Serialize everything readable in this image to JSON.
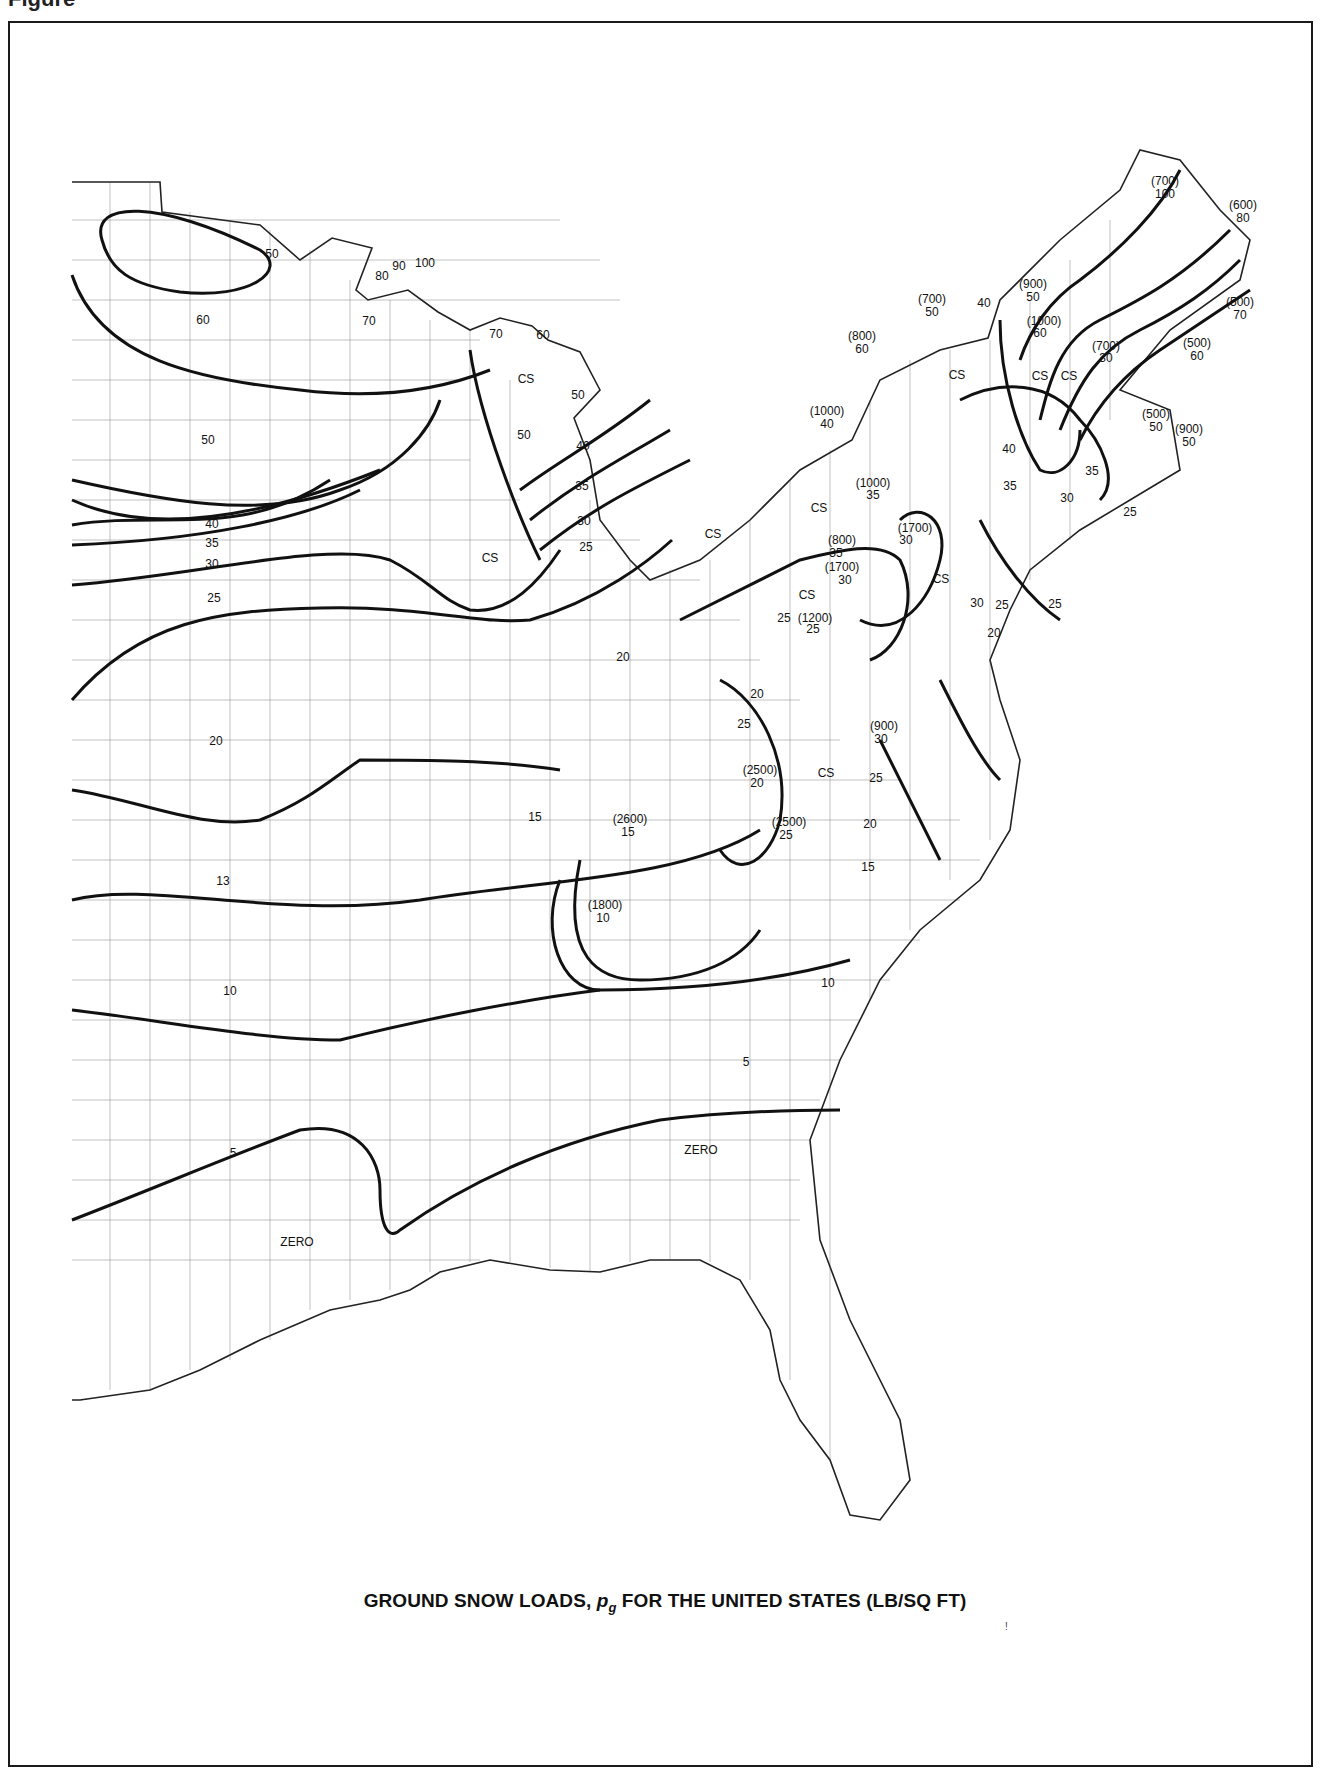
{
  "page": {
    "caption_top": "Figure",
    "title_main": "GROUND SNOW LOADS, ",
    "title_symbol": "p",
    "title_subscript": "g",
    "title_rest": " FOR THE UNITED STATES (LB/SQ FT)",
    "stray_mark": "!"
  },
  "map": {
    "type": "contour map",
    "subject": "Ground snow loads, eastern United States",
    "units": "lb/sq ft",
    "notation": {
      "CS": "Case study required",
      "parenthetical": "(elevation ft) load value"
    },
    "labels": [
      {
        "text": "50",
        "x": 272,
        "y": 258
      },
      {
        "text": "60",
        "x": 203,
        "y": 324
      },
      {
        "text": "50",
        "x": 208,
        "y": 444
      },
      {
        "text": "80",
        "x": 382,
        "y": 280
      },
      {
        "text": "90",
        "x": 399,
        "y": 270
      },
      {
        "text": "100",
        "x": 425,
        "y": 267
      },
      {
        "text": "70",
        "x": 369,
        "y": 325
      },
      {
        "text": "70",
        "x": 496,
        "y": 338
      },
      {
        "text": "60",
        "x": 543,
        "y": 339
      },
      {
        "text": "CS",
        "x": 526,
        "y": 383
      },
      {
        "text": "50",
        "x": 578,
        "y": 399
      },
      {
        "text": "50",
        "x": 524,
        "y": 439
      },
      {
        "text": "40",
        "x": 583,
        "y": 450
      },
      {
        "text": "35",
        "x": 582,
        "y": 490
      },
      {
        "text": "30",
        "x": 584,
        "y": 525
      },
      {
        "text": "25",
        "x": 586,
        "y": 551
      },
      {
        "text": "40",
        "x": 212,
        "y": 528
      },
      {
        "text": "35",
        "x": 212,
        "y": 547
      },
      {
        "text": "30",
        "x": 212,
        "y": 568
      },
      {
        "text": "25",
        "x": 214,
        "y": 602
      },
      {
        "text": "CS",
        "x": 490,
        "y": 562
      },
      {
        "text": "20",
        "x": 623,
        "y": 661
      },
      {
        "text": "20",
        "x": 216,
        "y": 745
      },
      {
        "text": "15",
        "x": 535,
        "y": 821
      },
      {
        "text": "13",
        "x": 223,
        "y": 885
      },
      {
        "text": "10",
        "x": 230,
        "y": 995
      },
      {
        "text": "10",
        "x": 828,
        "y": 987
      },
      {
        "text": "5",
        "x": 746,
        "y": 1066
      },
      {
        "text": "5",
        "x": 233,
        "y": 1157
      },
      {
        "text": "ZERO",
        "x": 297,
        "y": 1246
      },
      {
        "text": "ZERO",
        "x": 701,
        "y": 1154
      },
      {
        "text": "(700)",
        "x": 1165,
        "y": 185
      },
      {
        "text": "100",
        "x": 1165,
        "y": 198
      },
      {
        "text": "(600)",
        "x": 1243,
        "y": 209
      },
      {
        "text": "80",
        "x": 1243,
        "y": 222
      },
      {
        "text": "(900)",
        "x": 1033,
        "y": 288
      },
      {
        "text": "50",
        "x": 1033,
        "y": 301
      },
      {
        "text": "(700)",
        "x": 932,
        "y": 303
      },
      {
        "text": "50",
        "x": 932,
        "y": 316
      },
      {
        "text": "40",
        "x": 984,
        "y": 307
      },
      {
        "text": "(1000)",
        "x": 1044,
        "y": 325
      },
      {
        "text": "60",
        "x": 1040,
        "y": 337
      },
      {
        "text": "(500)",
        "x": 1240,
        "y": 306
      },
      {
        "text": "70",
        "x": 1240,
        "y": 319
      },
      {
        "text": "(800)",
        "x": 862,
        "y": 340
      },
      {
        "text": "60",
        "x": 862,
        "y": 353
      },
      {
        "text": "(500)",
        "x": 1197,
        "y": 347
      },
      {
        "text": "60",
        "x": 1197,
        "y": 360
      },
      {
        "text": "(700)",
        "x": 1106,
        "y": 350
      },
      {
        "text": "30",
        "x": 1106,
        "y": 362
      },
      {
        "text": "CS",
        "x": 957,
        "y": 379
      },
      {
        "text": "CS",
        "x": 1040,
        "y": 380
      },
      {
        "text": "CS",
        "x": 1069,
        "y": 380
      },
      {
        "text": "(1000)",
        "x": 827,
        "y": 415
      },
      {
        "text": "40",
        "x": 827,
        "y": 428
      },
      {
        "text": "(500)",
        "x": 1156,
        "y": 418
      },
      {
        "text": "50",
        "x": 1156,
        "y": 431
      },
      {
        "text": "(900)",
        "x": 1189,
        "y": 433
      },
      {
        "text": "50",
        "x": 1189,
        "y": 446
      },
      {
        "text": "40",
        "x": 1009,
        "y": 453
      },
      {
        "text": "35",
        "x": 1092,
        "y": 475
      },
      {
        "text": "(1000)",
        "x": 873,
        "y": 487
      },
      {
        "text": "35",
        "x": 873,
        "y": 499
      },
      {
        "text": "35",
        "x": 1010,
        "y": 490
      },
      {
        "text": "30",
        "x": 1067,
        "y": 502
      },
      {
        "text": "CS",
        "x": 819,
        "y": 512
      },
      {
        "text": "25",
        "x": 1130,
        "y": 516
      },
      {
        "text": "CS",
        "x": 713,
        "y": 538
      },
      {
        "text": "(1700)",
        "x": 915,
        "y": 532
      },
      {
        "text": "30",
        "x": 906,
        "y": 544
      },
      {
        "text": "(800)",
        "x": 842,
        "y": 544
      },
      {
        "text": "35",
        "x": 836,
        "y": 557
      },
      {
        "text": "(1700)",
        "x": 842,
        "y": 571
      },
      {
        "text": "30",
        "x": 845,
        "y": 584
      },
      {
        "text": "CS",
        "x": 941,
        "y": 583
      },
      {
        "text": "25",
        "x": 1055,
        "y": 608
      },
      {
        "text": "CS",
        "x": 807,
        "y": 599
      },
      {
        "text": "25",
        "x": 784,
        "y": 622
      },
      {
        "text": "(1200)",
        "x": 815,
        "y": 622
      },
      {
        "text": "25",
        "x": 813,
        "y": 633
      },
      {
        "text": "30",
        "x": 977,
        "y": 607
      },
      {
        "text": "25",
        "x": 1002,
        "y": 609
      },
      {
        "text": "20",
        "x": 994,
        "y": 637
      },
      {
        "text": "20",
        "x": 757,
        "y": 698
      },
      {
        "text": "25",
        "x": 744,
        "y": 728
      },
      {
        "text": "(900)",
        "x": 884,
        "y": 730
      },
      {
        "text": "30",
        "x": 881,
        "y": 743
      },
      {
        "text": "(2500)",
        "x": 760,
        "y": 774
      },
      {
        "text": "20",
        "x": 757,
        "y": 787
      },
      {
        "text": "CS",
        "x": 826,
        "y": 777
      },
      {
        "text": "25",
        "x": 876,
        "y": 782
      },
      {
        "text": "(2600)",
        "x": 630,
        "y": 823
      },
      {
        "text": "15",
        "x": 628,
        "y": 836
      },
      {
        "text": "(2500)",
        "x": 789,
        "y": 826
      },
      {
        "text": "25",
        "x": 786,
        "y": 839
      },
      {
        "text": "20",
        "x": 870,
        "y": 828
      },
      {
        "text": "15",
        "x": 868,
        "y": 871
      },
      {
        "text": "15",
        "x": 532,
        "y": 821
      },
      {
        "text": "(1800)",
        "x": 605,
        "y": 909
      },
      {
        "text": "10",
        "x": 603,
        "y": 922
      }
    ]
  }
}
